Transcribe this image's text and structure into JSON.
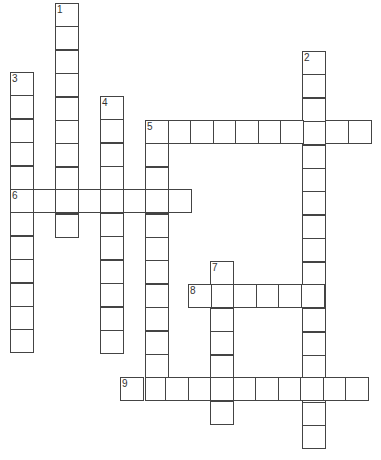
{
  "puzzle": {
    "cell_w": 22.5,
    "cell_h": 23.4,
    "words": [
      {
        "number": "1",
        "direction": "down",
        "x": 55,
        "y": 3,
        "length": 10
      },
      {
        "number": "2",
        "direction": "down",
        "x": 302,
        "y": 51,
        "length": 17
      },
      {
        "number": "3",
        "direction": "down",
        "x": 10,
        "y": 72,
        "length": 12
      },
      {
        "number": "4",
        "direction": "down",
        "x": 100,
        "y": 96,
        "length": 11
      },
      {
        "number": "5",
        "direction": "across",
        "x": 145,
        "y": 120,
        "length": 10
      },
      {
        "number": "5",
        "direction": "down",
        "x": 145,
        "y": 120,
        "length": 12
      },
      {
        "number": "6",
        "direction": "across",
        "x": 10,
        "y": 189,
        "length": 8
      },
      {
        "number": "7",
        "direction": "down",
        "x": 210,
        "y": 261,
        "length": 7
      },
      {
        "number": "8",
        "direction": "across",
        "x": 188,
        "y": 284,
        "length": 6
      },
      {
        "number": "9",
        "direction": "across",
        "x": 120,
        "y": 377,
        "length": 11
      }
    ]
  }
}
